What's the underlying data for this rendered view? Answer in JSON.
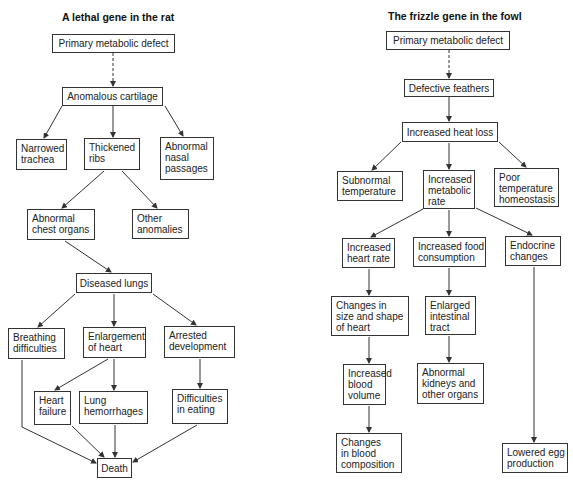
{
  "diagrams": [
    {
      "id": "rat",
      "title": "A lethal gene in the rat",
      "title_pos": [
        62,
        11
      ],
      "nodes": [
        {
          "id": "r_primary",
          "lines": [
            "Primary metabolic defect"
          ],
          "box": [
            52,
            34,
            123,
            19
          ],
          "center": true
        },
        {
          "id": "r_cartilage",
          "lines": [
            "Anomalous cartilage"
          ],
          "box": [
            62,
            87,
            101,
            19
          ],
          "center": true
        },
        {
          "id": "r_trachea",
          "lines": [
            "Narrowed",
            "trachea"
          ],
          "box": [
            16,
            139,
            51,
            31
          ]
        },
        {
          "id": "r_ribs",
          "lines": [
            "Thickened",
            "ribs"
          ],
          "box": [
            84,
            138,
            56,
            32
          ]
        },
        {
          "id": "r_nasal",
          "lines": [
            "Abnormal",
            "nasal",
            "passages"
          ],
          "box": [
            160,
            137,
            54,
            43
          ]
        },
        {
          "id": "r_chest",
          "lines": [
            "Abnormal",
            "chest organs"
          ],
          "box": [
            27,
            209,
            68,
            31
          ]
        },
        {
          "id": "r_other",
          "lines": [
            "Other",
            "anomalies"
          ],
          "box": [
            132,
            209,
            57,
            30
          ]
        },
        {
          "id": "r_lungs",
          "lines": [
            "Diseased lungs"
          ],
          "box": [
            76,
            273,
            76,
            20
          ],
          "center": true
        },
        {
          "id": "r_breathing",
          "lines": [
            "Breathing",
            "difficulties"
          ],
          "box": [
            8,
            328,
            57,
            31
          ]
        },
        {
          "id": "r_enlarge",
          "lines": [
            "Enlargement",
            "of heart"
          ],
          "box": [
            83,
            327,
            63,
            31
          ]
        },
        {
          "id": "r_arrested",
          "lines": [
            "Arrested",
            "development"
          ],
          "box": [
            164,
            326,
            71,
            32
          ]
        },
        {
          "id": "r_heartfail",
          "lines": [
            "Heart",
            "failure"
          ],
          "box": [
            34,
            391,
            37,
            34
          ]
        },
        {
          "id": "r_hemorrhage",
          "lines": [
            "Lung",
            "hemorrhages"
          ],
          "box": [
            79,
            391,
            69,
            33
          ]
        },
        {
          "id": "r_eating",
          "lines": [
            "Difficulties",
            "in eating"
          ],
          "box": [
            172,
            389,
            56,
            35
          ]
        },
        {
          "id": "r_death",
          "lines": [
            "Death"
          ],
          "box": [
            97,
            458,
            35,
            20
          ],
          "center": true
        }
      ],
      "edges": [
        {
          "from": [
            113,
            53
          ],
          "to": [
            113,
            86
          ],
          "dashed": true
        },
        {
          "from": [
            62,
            106
          ],
          "to": [
            44,
            138
          ]
        },
        {
          "from": [
            113,
            106
          ],
          "to": [
            113,
            137
          ]
        },
        {
          "from": [
            165,
            106
          ],
          "to": [
            183,
            136
          ]
        },
        {
          "from": [
            104,
            171
          ],
          "to": [
            62,
            208
          ]
        },
        {
          "from": [
            122,
            171
          ],
          "to": [
            157,
            208
          ]
        },
        {
          "from": [
            65,
            241
          ],
          "to": [
            111,
            272
          ]
        },
        {
          "from": [
            75,
            294
          ],
          "to": [
            38,
            327
          ]
        },
        {
          "from": [
            114,
            294
          ],
          "to": [
            114,
            326
          ]
        },
        {
          "from": [
            153,
            294
          ],
          "to": [
            196,
            325
          ]
        },
        {
          "from": [
            108,
            359
          ],
          "to": [
            55,
            390
          ]
        },
        {
          "from": [
            114,
            359
          ],
          "to": [
            114,
            390
          ]
        },
        {
          "from": [
            200,
            359
          ],
          "to": [
            200,
            388
          ]
        },
        {
          "from": [
            22,
            360
          ],
          "to": [
            22,
            427
          ],
          "nohead": true
        },
        {
          "from": [
            22,
            427
          ],
          "to": [
            96,
            463
          ]
        },
        {
          "from": [
            72,
            426
          ],
          "to": [
            104,
            457
          ]
        },
        {
          "from": [
            115,
            425
          ],
          "to": [
            115,
            457
          ]
        },
        {
          "from": [
            197,
            425
          ],
          "to": [
            133,
            462
          ]
        }
      ]
    },
    {
      "id": "fowl",
      "title": "The frizzle gene in the fowl",
      "title_pos": [
        388,
        10
      ],
      "nodes": [
        {
          "id": "f_primary",
          "lines": [
            "Primary metabolic defect"
          ],
          "box": [
            386,
            31,
            124,
            19
          ],
          "center": true
        },
        {
          "id": "f_feathers",
          "lines": [
            "Defective feathers"
          ],
          "box": [
            404,
            79,
            90,
            18
          ],
          "center": true
        },
        {
          "id": "f_heatloss",
          "lines": [
            "Increased heat loss"
          ],
          "box": [
            402,
            122,
            96,
            20
          ],
          "center": true
        },
        {
          "id": "f_subnormal",
          "lines": [
            "Subnormal",
            "temperature"
          ],
          "box": [
            337,
            171,
            66,
            30
          ]
        },
        {
          "id": "f_metabolic",
          "lines": [
            "Increased",
            "metabolic",
            "rate"
          ],
          "box": [
            423,
            170,
            52,
            39
          ]
        },
        {
          "id": "f_homeostasis",
          "lines": [
            "Poor",
            "temperature",
            "homeostasis"
          ],
          "box": [
            494,
            168,
            65,
            39
          ]
        },
        {
          "id": "f_heartrate",
          "lines": [
            "Increased",
            "heart rate"
          ],
          "box": [
            342,
            238,
            53,
            30
          ]
        },
        {
          "id": "f_food",
          "lines": [
            "Increased food",
            "consumption"
          ],
          "box": [
            413,
            237,
            73,
            30
          ]
        },
        {
          "id": "f_endocrine",
          "lines": [
            "Endocrine",
            "changes"
          ],
          "box": [
            505,
            236,
            56,
            30
          ]
        },
        {
          "id": "f_heartshape",
          "lines": [
            "Changes in",
            "size and shape",
            "of heart"
          ],
          "box": [
            331,
            296,
            78,
            40
          ]
        },
        {
          "id": "f_intestinal",
          "lines": [
            "Enlarged",
            "intestinal",
            "tract"
          ],
          "box": [
            425,
            296,
            51,
            39
          ]
        },
        {
          "id": "f_bloodvol",
          "lines": [
            "Increased",
            "blood",
            "volume"
          ],
          "box": [
            343,
            364,
            43,
            41
          ]
        },
        {
          "id": "f_kidneys",
          "lines": [
            "Abnormal",
            "kidneys and",
            "other organs"
          ],
          "box": [
            417,
            363,
            67,
            41
          ]
        },
        {
          "id": "f_bloodcomp",
          "lines": [
            "Changes",
            "in blood",
            "composition"
          ],
          "box": [
            336,
            433,
            66,
            40
          ]
        },
        {
          "id": "f_egg",
          "lines": [
            "Lowered egg",
            "production"
          ],
          "box": [
            502,
            443,
            66,
            30
          ]
        }
      ],
      "edges": [
        {
          "from": [
            449,
            50
          ],
          "to": [
            449,
            78
          ],
          "dashed": true
        },
        {
          "from": [
            449,
            97
          ],
          "to": [
            449,
            121
          ]
        },
        {
          "from": [
            401,
            142
          ],
          "to": [
            372,
            170
          ]
        },
        {
          "from": [
            449,
            143
          ],
          "to": [
            449,
            169
          ]
        },
        {
          "from": [
            499,
            142
          ],
          "to": [
            526,
            167
          ]
        },
        {
          "from": [
            423,
            209
          ],
          "to": [
            371,
            237
          ]
        },
        {
          "from": [
            449,
            210
          ],
          "to": [
            449,
            236
          ]
        },
        {
          "from": [
            476,
            208
          ],
          "to": [
            532,
            235
          ]
        },
        {
          "from": [
            369,
            269
          ],
          "to": [
            369,
            295
          ]
        },
        {
          "from": [
            449,
            268
          ],
          "to": [
            449,
            295
          ]
        },
        {
          "from": [
            534,
            267
          ],
          "to": [
            534,
            442
          ]
        },
        {
          "from": [
            369,
            337
          ],
          "to": [
            369,
            363
          ]
        },
        {
          "from": [
            449,
            336
          ],
          "to": [
            449,
            362
          ]
        },
        {
          "from": [
            369,
            406
          ],
          "to": [
            369,
            432
          ]
        }
      ]
    }
  ],
  "colors": {
    "line": "#333333",
    "box_border": "#333333",
    "text": "#222222",
    "background": "#ffffff"
  }
}
